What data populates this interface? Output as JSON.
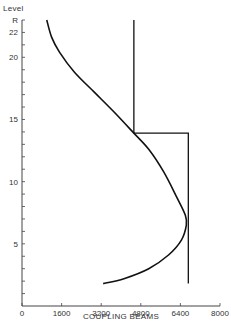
{
  "chart_data": {
    "type": "line",
    "title": "",
    "xlabel": "COUPLING BEAMS",
    "ylabel": "Level",
    "xlim": [
      0,
      8000
    ],
    "ylim": [
      0,
      23
    ],
    "x_ticks": [
      0,
      1600,
      3200,
      4800,
      6400,
      8000
    ],
    "x_tick_labels": [
      "0",
      "1600",
      "3200",
      "4800",
      "6400",
      "8000"
    ],
    "y_tick_labels": [
      {
        "level": 5,
        "label": "5"
      },
      {
        "level": 10,
        "label": "10"
      },
      {
        "level": 15,
        "label": "15"
      },
      {
        "level": 20,
        "label": "20"
      },
      {
        "level": 22,
        "label": "22"
      },
      {
        "level": 23,
        "label": "R"
      }
    ],
    "y_minor_ticks": [
      1,
      2,
      3,
      4,
      5,
      6,
      7,
      8,
      9,
      10,
      11,
      12,
      13,
      14,
      15,
      16,
      17,
      18,
      19,
      20,
      21,
      22,
      23
    ],
    "grid": false,
    "legend": null,
    "series": [
      {
        "name": "curve",
        "style": "smooth",
        "points": [
          {
            "x": 1000,
            "y": 23.0
          },
          {
            "x": 1200,
            "y": 21.6
          },
          {
            "x": 1520,
            "y": 20.4
          },
          {
            "x": 2120,
            "y": 18.8
          },
          {
            "x": 2920,
            "y": 17.2
          },
          {
            "x": 3720,
            "y": 15.6
          },
          {
            "x": 4520,
            "y": 13.9
          },
          {
            "x": 5120,
            "y": 12.6
          },
          {
            "x": 5720,
            "y": 10.8
          },
          {
            "x": 6240,
            "y": 8.8
          },
          {
            "x": 6600,
            "y": 7.3
          },
          {
            "x": 6640,
            "y": 6.5
          },
          {
            "x": 6440,
            "y": 5.3
          },
          {
            "x": 5920,
            "y": 4.1
          },
          {
            "x": 5120,
            "y": 3.0
          },
          {
            "x": 4120,
            "y": 2.2
          },
          {
            "x": 3280,
            "y": 1.8
          }
        ]
      },
      {
        "name": "step",
        "style": "step",
        "points": [
          {
            "x": 4520,
            "y": 23.0
          },
          {
            "x": 4520,
            "y": 13.9
          },
          {
            "x": 6720,
            "y": 13.9
          },
          {
            "x": 6720,
            "y": 1.8
          }
        ]
      }
    ]
  },
  "labels": {
    "y_axis_title": "Level",
    "x_axis_title": "COUPLING BEAMS"
  }
}
